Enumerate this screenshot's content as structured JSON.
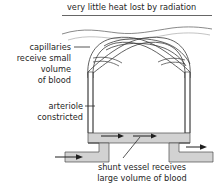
{
  "figure": {
    "title": "very little heat lost by radiation",
    "labels": {
      "capillaries_line1": "capillaries",
      "capillaries_line2": "receive small",
      "capillaries_line3": "volume",
      "capillaries_line4": "of blood",
      "arteriole_line1": "arteriole",
      "arteriole_line2": "constricted",
      "shunt_line1": "shunt vessel receives",
      "shunt_line2": "large volume of blood"
    },
    "colors": {
      "ink": "#262626",
      "outline": "#4a4a4a",
      "shunt_fill": "#d2d2d2",
      "skin_line": "#7a7a7a",
      "background": "#ffffff"
    },
    "elements": {
      "skin_surface": "wavy-skin-surface-line",
      "capillary_network": "crossing-capillary-loops",
      "arteriole_left": "constricted-arteriole-vessel",
      "venule_right": "return-vessel",
      "shunt_vessel": "wide-shunt-channel",
      "inlet_arrow": "blood-inflow-arrow",
      "outlet_arrow": "blood-outflow-arrow",
      "shunt_flow_arrows": "shunt-flow-direction-arrows"
    }
  }
}
